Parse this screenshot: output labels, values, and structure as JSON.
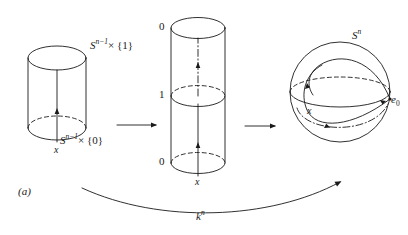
{
  "figure": {
    "panel_tag": "(a)",
    "caption_arrow_label": "k",
    "caption_arrow_label_sup": "n"
  },
  "left_cylinder": {
    "name": "cylinder-s-n-1-times-I",
    "top_label_base": "S",
    "top_label_sup": "n−1",
    "top_label_rest": "× {1}",
    "bottom_label_base": "S",
    "bottom_label_sup": "n−1",
    "bottom_label_rest": "× {0}",
    "basepoint_label": "x"
  },
  "middle_cylinder": {
    "name": "collapsed-cylinder",
    "top_label": "0",
    "middle_label": "1",
    "bottom_label": "0",
    "basepoint_label": "x"
  },
  "sphere": {
    "name": "sphere-s-n",
    "label_base": "S",
    "label_sup": "n",
    "basepoint_label": "e",
    "basepoint_sub": "0",
    "point_label": "x"
  },
  "arrows": {
    "arrow1_name": "arrow-left-to-middle",
    "arrow2_name": "arrow-middle-to-sphere",
    "curved_arrow_name": "curved-arrow-k-n"
  },
  "colors": {
    "ink": "#1a1a1a",
    "background": "#ffffff"
  }
}
